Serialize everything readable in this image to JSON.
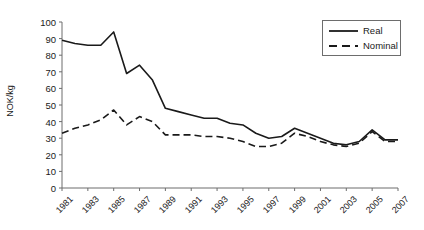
{
  "chart_data": {
    "type": "line",
    "title": "",
    "xlabel": "",
    "ylabel": "NOK/kg",
    "ylim": [
      0,
      100
    ],
    "xlim": [
      1981,
      2007
    ],
    "grid": false,
    "legend_position": "top-right",
    "ytick_labels": [
      "0",
      "10",
      "20",
      "30",
      "40",
      "50",
      "60",
      "70",
      "80",
      "90",
      "100"
    ],
    "ytick_values": [
      0,
      10,
      20,
      30,
      40,
      50,
      60,
      70,
      80,
      90,
      100
    ],
    "xtick_labels": [
      "1981",
      "1983",
      "1985",
      "1987",
      "1989",
      "1991",
      "1993",
      "1995",
      "1997",
      "1999",
      "2001",
      "2003",
      "2005",
      "2007"
    ],
    "xtick_values": [
      1981,
      1983,
      1985,
      1987,
      1989,
      1991,
      1993,
      1995,
      1997,
      1999,
      2001,
      2003,
      2005,
      2007
    ],
    "x": [
      1981,
      1982,
      1983,
      1984,
      1985,
      1986,
      1987,
      1988,
      1989,
      1990,
      1991,
      1992,
      1993,
      1994,
      1995,
      1996,
      1997,
      1998,
      1999,
      2000,
      2001,
      2002,
      2003,
      2004,
      2005,
      2006,
      2007
    ],
    "series": [
      {
        "name": "Real",
        "style": "solid",
        "color": "#1a1a1a",
        "values": [
          89,
          87,
          86,
          86,
          94,
          69,
          74,
          65,
          48,
          46,
          44,
          42,
          42,
          39,
          38,
          33,
          30,
          31,
          36,
          33,
          30,
          27,
          26,
          28,
          35,
          29,
          29
        ]
      },
      {
        "name": "Nominal",
        "style": "dashed",
        "color": "#1a1a1a",
        "values": [
          33,
          36,
          38,
          41,
          47,
          38,
          43,
          40,
          32,
          32,
          32,
          31,
          31,
          30,
          28,
          25,
          25,
          27,
          33,
          31,
          28,
          26,
          25,
          27,
          34,
          28,
          28
        ]
      }
    ]
  },
  "legend": {
    "items": [
      {
        "label": "Real"
      },
      {
        "label": "Nominal"
      }
    ]
  }
}
